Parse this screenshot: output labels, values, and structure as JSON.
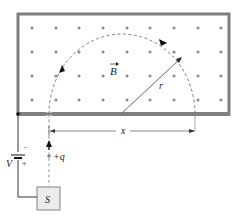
{
  "figure": {
    "field_label": "B",
    "radius_label": "r",
    "distance_label": "x",
    "voltage_label": "V",
    "charge_label": "+q",
    "source_label": "S",
    "battery_minus": "−",
    "battery_plus": "+",
    "field_direction": "out of page (dots)",
    "colors": {
      "frame": "#7f7f7f",
      "dots": "#8c8c8c",
      "path": "#6e6e6e",
      "source_fill": "#ececec",
      "wire": "#333333"
    }
  }
}
